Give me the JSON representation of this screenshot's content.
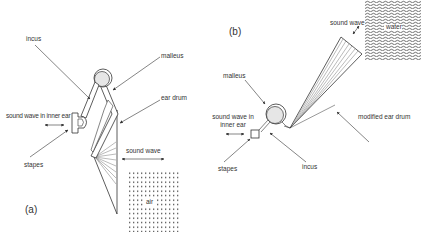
{
  "figure": {
    "panel_a": {
      "tag": "(a)",
      "labels": {
        "incus": "incus",
        "malleus": "malleus",
        "ear_drum": "ear drum",
        "sound_wave_inner": "sound wave in inner ear",
        "stapes": "stapes",
        "sound_wave": "sound wave",
        "medium": "air"
      }
    },
    "panel_b": {
      "tag": "(b)",
      "labels": {
        "sound_wave": "sound wave",
        "medium": "water",
        "malleus": "malleus",
        "modified_ear_drum": "modified ear drum",
        "sound_wave_inner_line1": "sound wave in",
        "sound_wave_inner_line2": "inner ear",
        "stapes": "stapes",
        "incus": "incus"
      }
    },
    "colors": {
      "line": "#333333",
      "bone_fill": "#e6e6e6",
      "text": "#333333"
    }
  }
}
